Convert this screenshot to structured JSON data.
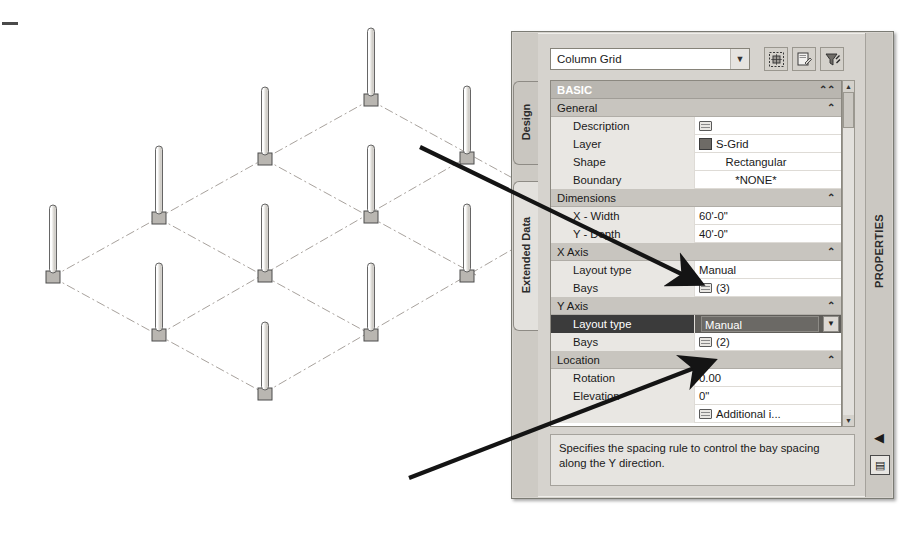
{
  "window": {
    "palette_title": "PROPERTIES",
    "close_label": "✕"
  },
  "tabs": [
    {
      "label": "Design",
      "active": true
    },
    {
      "label": "Extended Data",
      "active": false
    }
  ],
  "toolbar": {
    "style_value": "Column Grid",
    "dropdown_arrow": "▼",
    "buttons": [
      {
        "name": "select-similar-icon",
        "label": ""
      },
      {
        "name": "edit-style-icon",
        "label": ""
      },
      {
        "name": "quick-select-icon",
        "label": ""
      }
    ]
  },
  "grid": {
    "section": {
      "label": "BASIC",
      "chevron": "⌃"
    },
    "rows": [
      {
        "kind": "group",
        "label": "General",
        "chevron": "⌃",
        "indent": false
      },
      {
        "kind": "prop",
        "label": "Description",
        "value": "",
        "icon": "picker",
        "align": "left"
      },
      {
        "kind": "prop",
        "label": "Layer",
        "value": "S-Grid",
        "icon": "swatch",
        "align": "left"
      },
      {
        "kind": "prop",
        "label": "Shape",
        "value": "Rectangular",
        "icon": "none",
        "align": "center"
      },
      {
        "kind": "prop",
        "label": "Boundary",
        "value": "*NONE*",
        "icon": "none",
        "align": "center"
      },
      {
        "kind": "group",
        "label": "Dimensions",
        "chevron": "⌃",
        "indent": false
      },
      {
        "kind": "prop",
        "label": "X - Width",
        "value": "60'-0\"",
        "icon": "none",
        "align": "left"
      },
      {
        "kind": "prop",
        "label": "Y - Depth",
        "value": "40'-0\"",
        "icon": "none",
        "align": "left"
      },
      {
        "kind": "group",
        "label": "X Axis",
        "chevron": "⌃",
        "indent": false
      },
      {
        "kind": "prop",
        "label": "Layout type",
        "value": "Manual",
        "icon": "none",
        "align": "left"
      },
      {
        "kind": "prop",
        "label": "Bays",
        "value": "(3)",
        "icon": "picker",
        "align": "left"
      },
      {
        "kind": "group",
        "label": "Y Axis",
        "chevron": "⌃",
        "indent": false
      },
      {
        "kind": "selected",
        "label": "Layout type",
        "value": "Manual",
        "dropdown_arrow": "▼"
      },
      {
        "kind": "prop",
        "label": "Bays",
        "value": "(2)",
        "icon": "picker",
        "align": "left"
      },
      {
        "kind": "group",
        "label": "Location",
        "chevron": "⌃",
        "indent": false
      },
      {
        "kind": "prop",
        "label": "Rotation",
        "value": "0.00",
        "icon": "none",
        "align": "left"
      },
      {
        "kind": "prop",
        "label": "Elevation",
        "value": "0\"",
        "icon": "none",
        "align": "left"
      },
      {
        "kind": "prop",
        "label": "",
        "value": "Additional i...",
        "icon": "picker",
        "align": "left"
      }
    ]
  },
  "scrollbar": {
    "up_arrow": "▲",
    "down_arrow": "▼"
  },
  "description": "Specifies the spacing rule to control the bay spacing along the Y direction.",
  "rightbar": {
    "collapse_icon": "◀",
    "menu_icon": "▤"
  },
  "colors": {
    "palette_bg": "#d6d3ce",
    "section_header": "#b9b6b0",
    "group_header": "#c8c5bf",
    "row_label_bg": "#e9e7e3",
    "selected_label": "#3b3b3b",
    "selected_value": "#5f5d59",
    "grid_line": "#a09a96",
    "column_base": "#b8b5b0",
    "annotation_arrow": "#1a1a1a"
  },
  "drawing": {
    "type": "isometric-column-grid",
    "columns": 12,
    "grid_bays_x": 3,
    "grid_bays_y": 2,
    "nodes": [
      {
        "x": 52,
        "y": 277
      },
      {
        "x": 158,
        "y": 218
      },
      {
        "x": 264,
        "y": 159
      },
      {
        "x": 370,
        "y": 100
      },
      {
        "x": 158,
        "y": 335
      },
      {
        "x": 264,
        "y": 276
      },
      {
        "x": 370,
        "y": 217
      },
      {
        "x": 466,
        "y": 158
      },
      {
        "x": 264,
        "y": 393
      },
      {
        "x": 370,
        "y": 334
      },
      {
        "x": 466,
        "y": 277
      }
    ],
    "column_height": 68
  },
  "annotations": [
    {
      "name": "arrow-to-x-layout-type",
      "from": [
        420,
        147
      ],
      "to": [
        700,
        283
      ]
    },
    {
      "name": "arrow-to-y-layout-type",
      "from": [
        409,
        478
      ],
      "to": [
        712,
        362
      ]
    }
  ]
}
